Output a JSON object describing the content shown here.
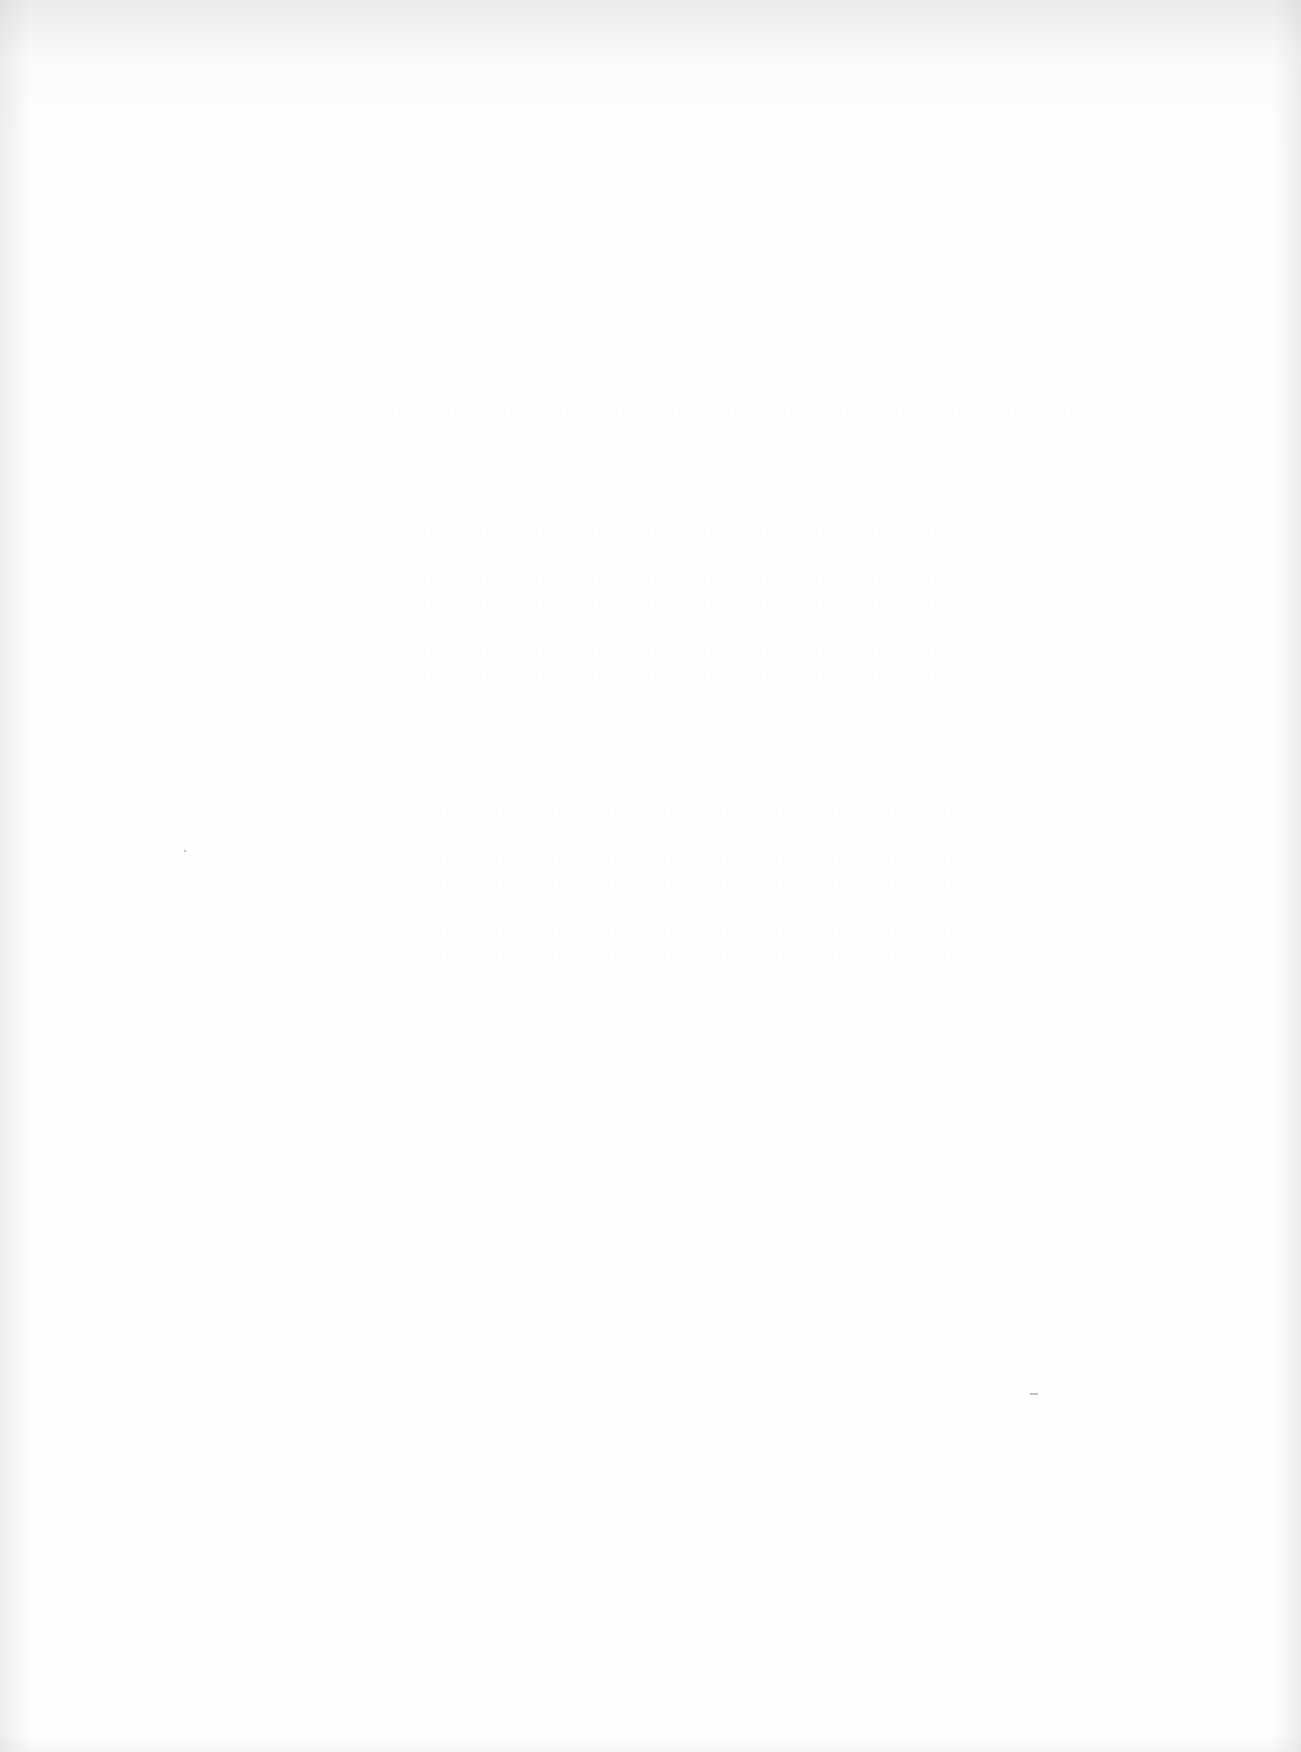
{
  "document": {
    "type": "scanned-page",
    "content": "",
    "state": "blank",
    "colors": {
      "paper": "#fefefe",
      "edge_shadow": "#d8d8d8",
      "speck": "#9a9a9a"
    }
  }
}
